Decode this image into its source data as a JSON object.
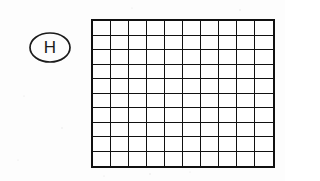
{
  "figure": {
    "label": "H",
    "label_shape": "oval",
    "caption": ""
  },
  "grid": {
    "columns": 10,
    "rows": 10,
    "total_cells": 100,
    "shaded_cells": 28,
    "unshaded_cells": 72,
    "fraction_shaded": "28/100",
    "line_color": "#111111",
    "cell_fill": "#ffffff",
    "shaded_fill_pattern": "halftone-dots",
    "shaded_fill_color": "#6f6f6f",
    "border_color": "#111111",
    "shaded_map": [
      [
        1,
        1,
        1,
        0,
        0,
        0,
        0,
        0,
        0,
        0
      ],
      [
        1,
        1,
        1,
        0,
        0,
        0,
        0,
        0,
        0,
        0
      ],
      [
        1,
        1,
        1,
        0,
        0,
        0,
        0,
        0,
        0,
        0
      ],
      [
        1,
        1,
        1,
        0,
        0,
        0,
        0,
        0,
        0,
        0
      ],
      [
        1,
        1,
        1,
        0,
        0,
        0,
        0,
        0,
        0,
        0
      ],
      [
        1,
        1,
        1,
        0,
        0,
        0,
        0,
        0,
        0,
        0
      ],
      [
        1,
        1,
        1,
        0,
        0,
        0,
        0,
        0,
        0,
        0
      ],
      [
        1,
        1,
        1,
        0,
        0,
        0,
        0,
        0,
        0,
        0
      ],
      [
        1,
        1,
        0,
        0,
        0,
        0,
        0,
        0,
        0,
        0
      ],
      [
        1,
        1,
        0,
        0,
        0,
        0,
        0,
        0,
        0,
        0
      ]
    ]
  }
}
